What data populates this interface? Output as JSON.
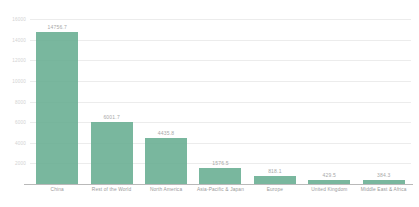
{
  "chart_data": {
    "type": "bar",
    "title": "",
    "subtitle": "",
    "xlabel": "",
    "ylabel": "",
    "grid": true,
    "legend": false,
    "ylim": [
      0,
      16000
    ],
    "yticks": [
      2000,
      4000,
      6000,
      8000,
      10000,
      12000,
      14000,
      16000
    ],
    "ytick_labels": [
      "2000",
      "4000",
      "6000",
      "8000",
      "10000",
      "12000",
      "14000",
      "16000"
    ],
    "categories": [
      "China",
      "Rest of the World",
      "North America",
      "Asia-Pacific & Japan",
      "Europe",
      "United Kingdom",
      "Middle East & Africa"
    ],
    "values": [
      14756.7,
      6001.7,
      4435.8,
      1576.5,
      818.1,
      429.5,
      384.3
    ],
    "value_labels": [
      "14756.7",
      "6001.7",
      "4435.8",
      "1576.5",
      "818.1",
      "429.5",
      "384.3"
    ],
    "series": [
      {
        "name": "",
        "values": [
          14756.7,
          6001.7,
          4435.8,
          1576.5,
          818.1,
          429.5,
          384.3
        ]
      }
    ],
    "colors": {
      "bar": "#63ab8e",
      "gridline": "#ececec",
      "axis": "#b9b9b9",
      "tick_text": "#d2d2d2",
      "label_text": "#9a9a9a",
      "value_text": "#a8a8a8",
      "background": "#ffffff"
    }
  }
}
